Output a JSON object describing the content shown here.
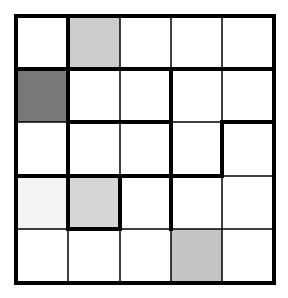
{
  "puzzle": {
    "rows": 5,
    "cols": 5,
    "origin": [
      16,
      16
    ],
    "x_lines": [
      16,
      68,
      120,
      171,
      222,
      274
    ],
    "y_lines": [
      16,
      69,
      122,
      176,
      229,
      283
    ],
    "thin_width": 1.5,
    "thick_width": 4,
    "outer_width": 4,
    "line_color": "#000000",
    "cells": [
      [
        "#ffffff",
        "#cccccc",
        "#ffffff",
        "#ffffff",
        "#ffffff"
      ],
      [
        "#787878",
        "#ffffff",
        "#ffffff",
        "#ffffff",
        "#ffffff"
      ],
      [
        "#ffffff",
        "#ffffff",
        "#ffffff",
        "#ffffff",
        "#ffffff"
      ],
      [
        "#f4f4f4",
        "#d6d6d6",
        "#ffffff",
        "#ffffff",
        "#ffffff"
      ],
      [
        "#ffffff",
        "#ffffff",
        "#ffffff",
        "#c4c4c4",
        "#ffffff"
      ]
    ],
    "v_thick": [
      [
        1,
        0,
        0,
        0
      ],
      [
        1,
        0,
        1,
        0
      ],
      [
        1,
        0,
        1,
        1
      ],
      [
        1,
        1,
        1,
        0
      ],
      [
        0,
        0,
        0,
        0
      ]
    ],
    "h_thick": [
      [
        1,
        1,
        1,
        1,
        1
      ],
      [
        0,
        1,
        1,
        0,
        1
      ],
      [
        1,
        1,
        1,
        1,
        0
      ],
      [
        0,
        1,
        0,
        0,
        0
      ]
    ]
  }
}
